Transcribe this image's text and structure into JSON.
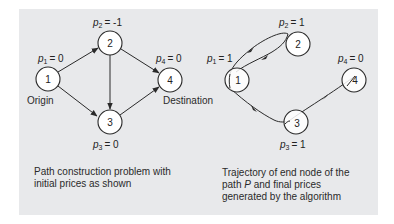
{
  "left_diagram": {
    "nodes": [
      {
        "id": "1",
        "label": "1",
        "price_var": "p",
        "price_sub": "1",
        "price_value": "= 0"
      },
      {
        "id": "2",
        "label": "2",
        "price_var": "p",
        "price_sub": "2",
        "price_value": "= -1"
      },
      {
        "id": "3",
        "label": "3",
        "price_var": "p",
        "price_sub": "3",
        "price_value": "= 0"
      },
      {
        "id": "4",
        "label": "4",
        "price_var": "p",
        "price_sub": "4",
        "price_value": "= 0"
      }
    ],
    "edges": [
      {
        "from": "1",
        "to": "2"
      },
      {
        "from": "1",
        "to": "3"
      },
      {
        "from": "2",
        "to": "3"
      },
      {
        "from": "2",
        "to": "4"
      },
      {
        "from": "3",
        "to": "4"
      }
    ],
    "origin_label": "Origin",
    "destination_label": "Destination",
    "caption": {
      "line1": "Path construction problem with",
      "line2": "initial prices as shown"
    }
  },
  "right_diagram": {
    "nodes": [
      {
        "id": "1",
        "label": "1",
        "price_var": "p",
        "price_sub": "1",
        "price_value": "= 1"
      },
      {
        "id": "2",
        "label": "2",
        "price_var": "p",
        "price_sub": "2",
        "price_value": "= 1"
      },
      {
        "id": "3",
        "label": "3",
        "price_var": "p",
        "price_sub": "3",
        "price_value": "= 1"
      },
      {
        "id": "4",
        "label": "4",
        "price_var": "p",
        "price_sub": "4",
        "price_value": "= 0"
      }
    ],
    "trajectory": [
      "1",
      "2",
      "1",
      "3",
      "4"
    ],
    "caption": {
      "line1": "Trajectory of end node of the",
      "line2_pre": "path ",
      "line2_var": "P",
      "line2_post": " and final prices",
      "line3": "generated by the algorithm"
    }
  }
}
